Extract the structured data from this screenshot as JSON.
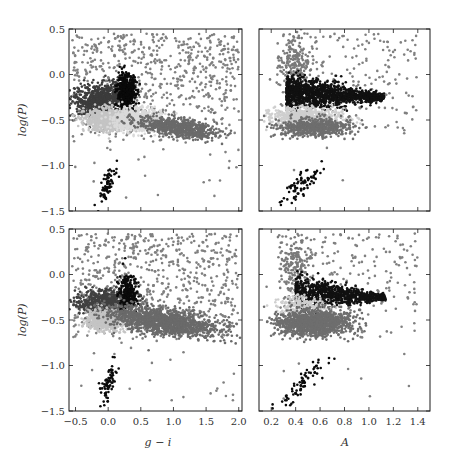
{
  "chart_data": [
    {
      "id": "top-left",
      "type": "scatter",
      "title": "",
      "xlabel": "",
      "ylabel": "log(P)",
      "xlim": [
        -0.6,
        2.05
      ],
      "ylim": [
        -1.5,
        0.5
      ],
      "xticks": [
        -0.5,
        0.0,
        0.5,
        1.0,
        1.5,
        2.0
      ],
      "xticklabels_visible": false,
      "yticks": [
        0.5,
        0.0,
        -0.5,
        -1.0,
        -1.5
      ],
      "yticklabels": [
        "0.5",
        "0.0",
        "−0.5",
        "−1.0",
        "−1.5"
      ],
      "grid": false,
      "series": [
        {
          "name": "background",
          "color": "#808080",
          "count": 700,
          "shape": "uniform",
          "x": [
            -0.55,
            2.0
          ],
          "y": [
            -0.75,
            0.45
          ],
          "note": "sparse scatter, denser toward top-left"
        },
        {
          "name": "group-dark",
          "color": "#3c3c3c",
          "count": 700,
          "shape": "tri",
          "cx": -0.1,
          "cy": -0.28,
          "sx": 0.22,
          "sy": 0.08
        },
        {
          "name": "group-black",
          "color": "#0a0a0a",
          "count": 500,
          "cx": 0.28,
          "cy": -0.2,
          "sx": 0.07,
          "sy": 0.1
        },
        {
          "name": "group-light",
          "color": "#c4c4c4",
          "count": 700,
          "cx": 0.0,
          "cy": -0.5,
          "sx": 0.18,
          "sy": 0.06
        },
        {
          "name": "group-lighter",
          "color": "#dadada",
          "count": 700,
          "cx": 0.45,
          "cy": -0.5,
          "sx": 0.18,
          "sy": 0.06
        },
        {
          "name": "group-mid",
          "color": "#6a6a6a",
          "count": 700,
          "cx": 1.05,
          "cy": -0.58,
          "sx": 0.3,
          "sy": 0.05
        },
        {
          "name": "short-period-clump",
          "color": "#0a0a0a",
          "count": 70,
          "cx": 0.0,
          "cy": -1.2,
          "sx": 0.07,
          "sy": 0.07
        }
      ]
    },
    {
      "id": "top-right",
      "type": "scatter",
      "xlabel": "",
      "ylabel": "",
      "xlim": [
        0.1,
        1.5
      ],
      "ylim": [
        -1.5,
        0.5
      ],
      "xticks": [
        0.2,
        0.4,
        0.6,
        0.8,
        1.0,
        1.2,
        1.4
      ],
      "xticklabels_visible": false,
      "yticks": [
        0.5,
        0.0,
        -0.5,
        -1.0,
        -1.5
      ],
      "yticklabels_visible": false,
      "grid": false,
      "series": [
        {
          "name": "background",
          "color": "#808080",
          "count": 220,
          "x": [
            0.25,
            1.4
          ],
          "y": [
            -0.7,
            0.45
          ]
        },
        {
          "name": "upper-gray",
          "color": "#7a7a7a",
          "count": 180,
          "cx": 0.4,
          "cy": 0.12,
          "sx": 0.07,
          "sy": 0.15
        },
        {
          "name": "group-black",
          "color": "#111111",
          "count": 1300,
          "shape": "wedge",
          "cx": 0.65,
          "cy": -0.2,
          "sx": 0.25,
          "sy": 0.09
        },
        {
          "name": "group-light",
          "color": "#cfcfcf",
          "count": 600,
          "cx": 0.5,
          "cy": -0.47,
          "sx": 0.15,
          "sy": 0.05
        },
        {
          "name": "group-mid",
          "color": "#6e6e6e",
          "count": 600,
          "cx": 0.55,
          "cy": -0.58,
          "sx": 0.15,
          "sy": 0.05
        },
        {
          "name": "short-period-clump",
          "color": "#0a0a0a",
          "count": 70,
          "cx": 0.45,
          "cy": -1.2,
          "sx": 0.09,
          "sy": 0.07
        }
      ]
    },
    {
      "id": "bottom-left",
      "type": "scatter",
      "xlabel": "g − i",
      "ylabel": "log(P)",
      "xlim": [
        -0.6,
        2.05
      ],
      "ylim": [
        -1.5,
        0.5
      ],
      "xticks": [
        -0.5,
        0.0,
        0.5,
        1.0,
        1.5,
        2.0
      ],
      "xticklabels": [
        "−0.5",
        "0.0",
        "0.5",
        "1.0",
        "1.5",
        "2.0"
      ],
      "yticks": [
        0.5,
        0.0,
        -0.5,
        -1.0,
        -1.5
      ],
      "yticklabels": [
        "0.5",
        "0.0",
        "−0.5",
        "−1.0",
        "−1.5"
      ],
      "grid": false,
      "series": [
        {
          "name": "background",
          "color": "#808080",
          "count": 700,
          "x": [
            -0.55,
            2.0
          ],
          "y": [
            -0.75,
            0.45
          ]
        },
        {
          "name": "group-dark",
          "color": "#404040",
          "count": 600,
          "cx": -0.05,
          "cy": -0.3,
          "sx": 0.22,
          "sy": 0.07
        },
        {
          "name": "group-black",
          "color": "#0a0a0a",
          "count": 250,
          "cx": 0.3,
          "cy": -0.2,
          "sx": 0.07,
          "sy": 0.1
        },
        {
          "name": "group-light",
          "color": "#c4c4c4",
          "count": 500,
          "cx": -0.05,
          "cy": -0.5,
          "sx": 0.15,
          "sy": 0.06
        },
        {
          "name": "group-mid",
          "color": "#6a6a6a",
          "count": 1400,
          "cx": 0.85,
          "cy": -0.52,
          "sx": 0.4,
          "sy": 0.07
        },
        {
          "name": "short-period-clump",
          "color": "#0a0a0a",
          "count": 70,
          "cx": 0.0,
          "cy": -1.2,
          "sx": 0.07,
          "sy": 0.07
        }
      ]
    },
    {
      "id": "bottom-right",
      "type": "scatter",
      "xlabel": "A",
      "ylabel": "",
      "xlim": [
        0.1,
        1.5
      ],
      "ylim": [
        -1.5,
        0.5
      ],
      "xticks": [
        0.2,
        0.4,
        0.6,
        0.8,
        1.0,
        1.2,
        1.4
      ],
      "xticklabels": [
        "0.2",
        "0.4",
        "0.6",
        "0.8",
        "1.0",
        "1.2",
        "1.4"
      ],
      "yticks": [
        0.5,
        0.0,
        -0.5,
        -1.0,
        -1.5
      ],
      "yticklabels_visible": false,
      "grid": false,
      "series": [
        {
          "name": "background",
          "color": "#808080",
          "count": 220,
          "x": [
            0.25,
            1.4
          ],
          "y": [
            -0.7,
            0.45
          ]
        },
        {
          "name": "upper-gray",
          "color": "#7a7a7a",
          "count": 180,
          "cx": 0.4,
          "cy": 0.12,
          "sx": 0.07,
          "sy": 0.15
        },
        {
          "name": "group-black",
          "color": "#111111",
          "count": 900,
          "shape": "wedge",
          "cx": 0.7,
          "cy": -0.2,
          "sx": 0.23,
          "sy": 0.08
        },
        {
          "name": "group-light",
          "color": "#cfcfcf",
          "count": 200,
          "cx": 0.45,
          "cy": -0.35,
          "sx": 0.1,
          "sy": 0.05
        },
        {
          "name": "group-mid",
          "color": "#6e6e6e",
          "count": 1300,
          "cx": 0.55,
          "cy": -0.53,
          "sx": 0.15,
          "sy": 0.07
        },
        {
          "name": "short-period-clump",
          "color": "#0a0a0a",
          "count": 70,
          "cx": 0.45,
          "cy": -1.2,
          "sx": 0.09,
          "sy": 0.07
        }
      ]
    }
  ],
  "labels": {
    "ylabel_left": "log(P)",
    "xlabel_left": "g − i",
    "xlabel_right": "A"
  }
}
